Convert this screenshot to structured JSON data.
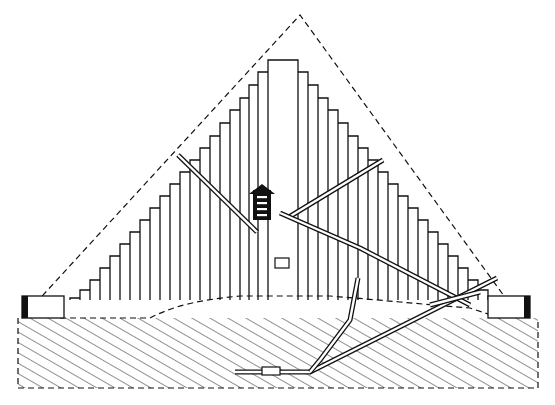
{
  "diagram": {
    "colors": {
      "ink": "#111111",
      "paper": "#ffffff"
    },
    "outer_casing": {
      "apex": [
        300,
        15
      ],
      "left_base": [
        22,
        318
      ],
      "right_base": [
        520,
        318
      ],
      "style": "dashed"
    },
    "core": {
      "top_block": {
        "x_left": 268,
        "x_right": 298,
        "y_top": 60
      },
      "left_steps": [
        [
          258,
          72
        ],
        [
          249,
          85
        ],
        [
          240,
          98
        ],
        [
          230,
          110
        ],
        [
          220,
          123
        ],
        [
          210,
          136
        ],
        [
          200,
          148
        ],
        [
          190,
          160
        ],
        [
          180,
          172
        ],
        [
          170,
          184
        ],
        [
          160,
          196
        ],
        [
          150,
          208
        ],
        [
          140,
          220
        ],
        [
          130,
          232
        ],
        [
          120,
          244
        ],
        [
          110,
          256
        ],
        [
          100,
          268
        ],
        [
          90,
          280
        ],
        [
          80,
          290
        ],
        [
          70,
          298
        ]
      ],
      "right_steps": [
        [
          308,
          72
        ],
        [
          318,
          85
        ],
        [
          328,
          98
        ],
        [
          338,
          110
        ],
        [
          348,
          123
        ],
        [
          358,
          136
        ],
        [
          368,
          148
        ],
        [
          378,
          160
        ],
        [
          388,
          172
        ],
        [
          398,
          184
        ],
        [
          408,
          196
        ],
        [
          418,
          208
        ],
        [
          428,
          220
        ],
        [
          438,
          232
        ],
        [
          448,
          244
        ],
        [
          458,
          256
        ],
        [
          468,
          268
        ],
        [
          478,
          280
        ],
        [
          488,
          290
        ],
        [
          498,
          298
        ]
      ]
    },
    "ground": {
      "top_y": 318,
      "bottom_y": 388,
      "left_x": 18,
      "right_x": 538,
      "style": "hatched"
    },
    "passages": [
      {
        "name": "left-air-shaft",
        "points": [
          [
            178,
            155
          ],
          [
            257,
            232
          ]
        ]
      },
      {
        "name": "right-air-shaft",
        "points": [
          [
            383,
            160
          ],
          [
            289,
            217
          ]
        ]
      },
      {
        "name": "grand-gallery",
        "points": [
          [
            280,
            213
          ],
          [
            360,
            248
          ],
          [
            470,
            305
          ]
        ]
      },
      {
        "name": "descending-passage",
        "points": [
          [
            497,
            278
          ],
          [
            310,
            372
          ],
          [
            235,
            372
          ]
        ]
      },
      {
        "name": "well-shaft",
        "points": [
          [
            358,
            278
          ],
          [
            350,
            320
          ],
          [
            320,
            360
          ],
          [
            310,
            372
          ]
        ]
      },
      {
        "name": "lower-right-shaft",
        "points": [
          [
            480,
            292
          ],
          [
            430,
            305
          ]
        ]
      }
    ],
    "chambers": [
      {
        "name": "kings-chamber",
        "x": 253,
        "y": 190,
        "w": 18,
        "h": 30
      },
      {
        "name": "queens-chamber",
        "x": 275,
        "y": 258,
        "w": 14,
        "h": 10
      },
      {
        "name": "subterranean-chamber",
        "x": 262,
        "y": 367,
        "w": 18,
        "h": 8
      }
    ],
    "enclosure_walls": [
      {
        "name": "left-wall",
        "x": 22,
        "y": 296,
        "w": 42,
        "h": 22
      },
      {
        "name": "right-wall",
        "x": 488,
        "y": 296,
        "w": 42,
        "h": 22
      }
    ]
  }
}
